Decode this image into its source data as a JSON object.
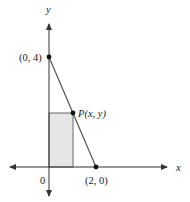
{
  "diagram": {
    "axes": {
      "x_label": "x",
      "y_label": "y",
      "origin_label": "0"
    },
    "points": [
      {
        "id": "y-intercept",
        "label": "(0, 4)"
      },
      {
        "id": "x-intercept",
        "label": "(2, 0)"
      },
      {
        "id": "p",
        "label": "P(x, y)"
      }
    ],
    "line": {
      "from": "(0, 4)",
      "to": "(2, 0)"
    },
    "rectangle": {
      "corner": "P(x, y)",
      "fill": "#e6e6e6",
      "stroke": "#555555"
    },
    "colors": {
      "axis": "#333333",
      "line": "#555555",
      "point": "#111111"
    }
  }
}
